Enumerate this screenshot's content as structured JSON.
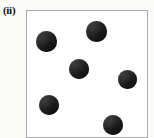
{
  "figure": {
    "panel_label": "(ii)",
    "width": 154,
    "height": 138,
    "background_color": "#fbfbfa"
  },
  "field_box": {
    "x": 26,
    "y": 10,
    "width": 122,
    "height": 128,
    "fill_color": "#ffffff",
    "border_color": "#a9a9a9",
    "border_width": 1
  },
  "chart_data": {
    "type": "scatter",
    "title": "(ii)",
    "xlabel": "",
    "ylabel": "",
    "xlim": [
      0,
      122
    ],
    "ylim": [
      0,
      128
    ],
    "grid": false,
    "legend": "none",
    "marker": {
      "shape": "circle",
      "color": "#242424",
      "mean_radius_px": 10
    },
    "count": 6,
    "points": [
      {
        "id": "particle-1",
        "x": 19,
        "y": 30,
        "r": 10.5
      },
      {
        "id": "particle-2",
        "x": 69,
        "y": 20,
        "r": 10.5
      },
      {
        "id": "particle-3",
        "x": 52,
        "y": 58,
        "r": 10.0
      },
      {
        "id": "particle-4",
        "x": 100,
        "y": 68,
        "r": 9.5
      },
      {
        "id": "particle-5",
        "x": 22,
        "y": 94,
        "r": 10.0
      },
      {
        "id": "particle-6",
        "x": 86,
        "y": 114,
        "r": 10.0
      }
    ]
  }
}
